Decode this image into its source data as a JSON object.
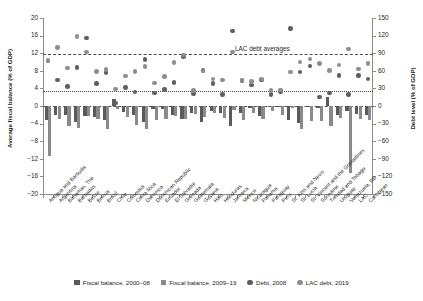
{
  "chart_data": {
    "type": "bar",
    "title": "",
    "subtitle": "",
    "ylabel": "Average fiscal balance (% of GDP)",
    "ylabel_right": "Debt level (% of GDP)",
    "xlabel": "",
    "ylim": [
      -20,
      20
    ],
    "ylim_right": [
      -150,
      150
    ],
    "yticks": [
      "20",
      "16",
      "12",
      "8",
      "4",
      "0",
      "-4",
      "-8",
      "-12",
      "-16",
      "-20"
    ],
    "yticks_right": [
      "150",
      "120",
      "90",
      "60",
      "30",
      "0",
      "-30",
      "-60",
      "-90",
      "-120",
      "-150"
    ],
    "grid": false,
    "legend_position": "bottom",
    "annotations": [
      {
        "text": "LAC debt averages",
        "y_left": 11.7,
        "y_right": 88
      }
    ],
    "reference_lines": [
      {
        "name": "lac-debt-2019-average",
        "style": "dashed",
        "y_left": 11.7,
        "y_right": 88
      },
      {
        "name": "lac-debt-2008-average",
        "style": "dotted",
        "y_left": 3.35,
        "y_right": 25
      },
      {
        "name": "zero",
        "style": "dashed",
        "y_left": 0,
        "y_right": 0
      }
    ],
    "categories": [
      "Antigua and Barbuda",
      "Argentina",
      "Bahamas, The",
      "Barbados",
      "Belize",
      "Bolivia",
      "Brazil",
      "Chile",
      "Colombia",
      "Costa Rica",
      "Dominica",
      "Dominican Republic",
      "Ecuador",
      "El Salvador",
      "Grenada",
      "Guatemala",
      "Guyana",
      "Haiti",
      "Honduras",
      "Jamaica",
      "Mexico",
      "Nicaragua",
      "Panama",
      "Paraguay",
      "Peru",
      "St. Kitts and Nevis",
      "St. Lucia",
      "St. Vincent and the Grenadines",
      "Suriname",
      "Trinidad and Tobago",
      "Uruguay",
      "Venezuela, RB",
      "LAC",
      "Caribbean"
    ],
    "series": [
      {
        "name": "Fiscal balance, 2000–08",
        "kind": "bar",
        "color": "#5a5a5a",
        "axis": "left",
        "unit": "% of GDP",
        "values": [
          -3.1,
          -2.1,
          -2.0,
          -3.6,
          -2.2,
          -2.6,
          -3.1,
          1.6,
          -1.3,
          -2.1,
          -3.6,
          -0.6,
          -0.7,
          -2.1,
          -3.0,
          -1.6,
          -3.6,
          -1.1,
          -1.5,
          -4.6,
          -1.5,
          -0.4,
          -2.3,
          -0.2,
          -0.3,
          -3.2,
          -3.9,
          -0.2,
          -0.4,
          2.1,
          -2.0,
          -1.2,
          -1.8,
          -2.1
        ]
      },
      {
        "name": "Fiscal balance, 2009–19",
        "kind": "bar",
        "color": "#8a8a8a",
        "axis": "left",
        "unit": "% of GDP",
        "values": [
          -11.4,
          -3.0,
          -4.5,
          -5.1,
          -2.2,
          -2.9,
          -5.3,
          -0.6,
          -2.6,
          -4.4,
          -5.2,
          -3.1,
          -2.9,
          -2.2,
          -3.0,
          -1.8,
          -2.4,
          -1.7,
          -2.8,
          -1.0,
          -3.1,
          -1.6,
          -2.9,
          -1.2,
          -2.0,
          -0.4,
          -5.3,
          -3.3,
          -3.4,
          -4.5,
          -2.7,
          -15.2,
          -3.0,
          -3.1
        ]
      },
      {
        "name": "Debt, 2008",
        "kind": "scatter",
        "color": "#5e5e5e",
        "axis": "right",
        "unit": "% of GDP",
        "values": [
          77,
          44,
          33,
          66,
          116,
          38,
          57,
          5,
          32,
          24,
          79,
          22,
          28,
          40,
          84,
          21,
          61,
          38,
          20,
          128,
          43,
          36,
          44,
          20,
          25,
          132,
          58,
          68,
          15,
          22,
          52,
          20,
          52,
          46
        ]
      },
      {
        "name": "LAC debt, 2019",
        "kind": "scatter",
        "color": "#8e8e8e",
        "axis": "right",
        "unit": "% of GDP",
        "values": [
          78,
          100,
          65,
          118,
          92,
          59,
          62,
          29,
          51,
          59,
          67,
          39,
          50,
          74,
          87,
          26,
          60,
          46,
          44,
          92,
          44,
          42,
          46,
          26,
          27,
          58,
          75,
          80,
          72,
          61,
          70,
          97,
          63,
          72
        ]
      }
    ]
  },
  "legend": {
    "items": [
      {
        "label": "Fiscal balance, 2000–08",
        "marker": "square",
        "color": "#5a5a5a"
      },
      {
        "label": "Fiscal balance, 2009–19",
        "marker": "square",
        "color": "#8a8a8a"
      },
      {
        "label": "Debt, 2008",
        "marker": "circle",
        "color": "#5e5e5e"
      },
      {
        "label": "LAC debt, 2019",
        "marker": "circle",
        "color": "#8e8e8e"
      }
    ]
  }
}
